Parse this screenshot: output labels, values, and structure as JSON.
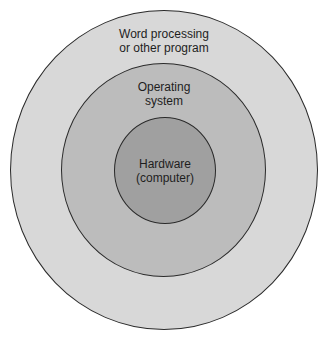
{
  "diagram": {
    "type": "concentric-layers",
    "layers": [
      {
        "id": "outer",
        "label_lines": [
          "Word processing",
          "or other program"
        ],
        "fill": "#d8d8d8"
      },
      {
        "id": "middle",
        "label_lines": [
          "Operating",
          "system"
        ],
        "fill": "#bcbcbc"
      },
      {
        "id": "inner",
        "label_lines": [
          "Hardware",
          "(computer)"
        ],
        "fill": "#a0a0a0"
      }
    ],
    "stroke": "#2a2a2a",
    "background": "#ffffff"
  }
}
